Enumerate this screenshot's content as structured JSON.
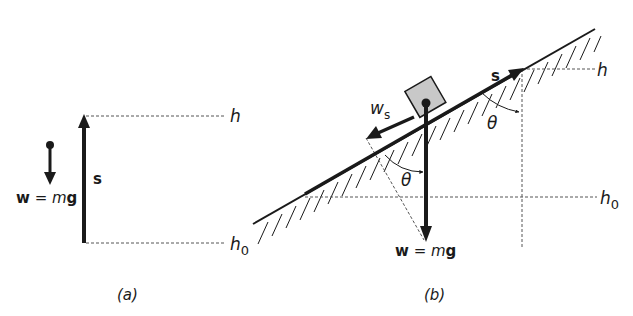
{
  "panel_a": {
    "caption": "(a)",
    "label_h": "h",
    "label_h0": "h",
    "label_h0_sub": "0",
    "label_s": "s",
    "weight_w": "w",
    "weight_eq": " = ",
    "weight_m": "m",
    "weight_g": "g"
  },
  "panel_b": {
    "caption": "(b)",
    "label_h": "h",
    "label_h0": "h",
    "label_h0_sub": "0",
    "label_s": "s",
    "label_ws": "w",
    "label_ws_sub": "s",
    "theta_upper": "θ",
    "theta_lower": "θ",
    "weight_w": "w",
    "weight_eq": " = ",
    "weight_m": "m",
    "weight_g": "g"
  },
  "colors": {
    "ink": "#1a1a1a",
    "block_fill": "#c8c8c8",
    "dashed": "#555555"
  }
}
